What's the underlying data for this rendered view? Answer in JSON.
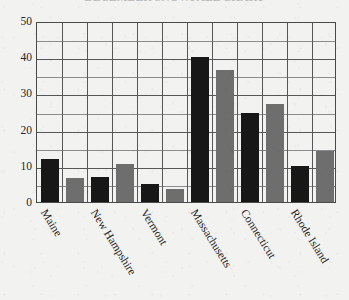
{
  "figure": {
    "title": "DECEMBER SNOWFALL CHART",
    "title_clipped": true,
    "background_color": "#f2f2f0"
  },
  "axes": {
    "y_ticks": [
      0,
      10,
      20,
      30,
      40,
      50
    ],
    "y_minor_step": 5,
    "y_min": 0,
    "y_max": 50,
    "series_colors": {
      "series_a": "#171717",
      "series_b": "#6e6e6e"
    },
    "grid_color": "#8c8c8c",
    "frame_color": "#4a4a4a"
  },
  "chart_data": {
    "type": "bar",
    "title": "DECEMBER SNOWFALL CHART",
    "xlabel": "",
    "ylabel": "",
    "ylim": [
      0,
      50
    ],
    "grid": true,
    "legend": "none",
    "categories": [
      "Maine",
      "New Hampshire",
      "Vermont",
      "Massachusetts",
      "Connecticut",
      "Rhode Island"
    ],
    "series": [
      {
        "name": "Series 1",
        "color": "#171717",
        "values": [
          12,
          7,
          5,
          40,
          24.5,
          10
        ]
      },
      {
        "name": "Series 2",
        "color": "#6e6e6e",
        "values": [
          6.5,
          10.5,
          3.5,
          36.5,
          27,
          14
        ]
      }
    ]
  }
}
